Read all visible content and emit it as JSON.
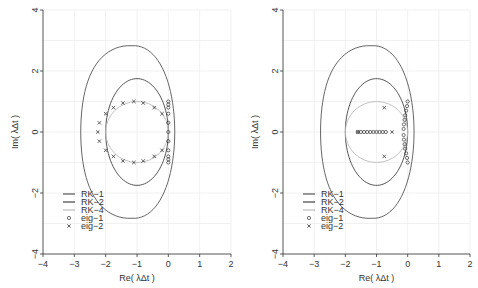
{
  "chart_data": [
    {
      "type": "scatter",
      "panel": "left",
      "xlabel": "Re( λΔt )",
      "ylabel": "Im( λΔt )",
      "xlim": [
        -4,
        2
      ],
      "ylim": [
        -4,
        4
      ],
      "xticks": [
        "-4",
        "-3",
        "-2",
        "-1",
        "0",
        "1",
        "2"
      ],
      "yticks": [
        "-4",
        "-2",
        "0",
        "2",
        "4"
      ],
      "grid": true,
      "legend": {
        "position": "bottom-left",
        "entries": [
          {
            "label": "RK-1",
            "style": "line",
            "color": "#555555"
          },
          {
            "label": "RK-2",
            "style": "line",
            "color": "#444444"
          },
          {
            "label": "RK-4",
            "style": "line",
            "color": "#bbbbbb"
          },
          {
            "label": "eig-1",
            "style": "circle",
            "color": "#333333"
          },
          {
            "label": "eig-2",
            "style": "cross",
            "color": "#333333"
          }
        ]
      },
      "series": [
        {
          "name": "RK-1",
          "shape": "circle",
          "center": [
            -1,
            0
          ],
          "radius": 1
        },
        {
          "name": "RK-2",
          "shape": "curve",
          "extent": {
            "xmin": -2,
            "xmax": 0,
            "ymin": -1.75,
            "ymax": 1.75
          }
        },
        {
          "name": "RK-4",
          "shape": "curve",
          "extent": {
            "xmin": -2.79,
            "xmax": 0.2,
            "ymin": -2.83,
            "ymax": 2.83
          }
        },
        {
          "name": "eig-1",
          "points": [
            [
              0,
              1
            ],
            [
              0,
              0.9
            ],
            [
              0,
              0.8
            ],
            [
              0,
              0.6
            ],
            [
              0,
              0.3
            ],
            [
              0,
              0
            ],
            [
              0,
              -0.3
            ],
            [
              0,
              -0.6
            ],
            [
              0,
              -0.8
            ],
            [
              0,
              -0.9
            ],
            [
              0,
              -1
            ]
          ]
        },
        {
          "name": "eig-2",
          "points": [
            [
              -2,
              0.6
            ],
            [
              -2.2,
              0.3
            ],
            [
              -2.25,
              0
            ],
            [
              -2.2,
              -0.3
            ],
            [
              -2,
              -0.6
            ],
            [
              -1.75,
              0.8
            ],
            [
              -1.45,
              0.95
            ],
            [
              -1.1,
              1
            ],
            [
              -0.8,
              0.95
            ],
            [
              -0.45,
              0.8
            ],
            [
              -0.2,
              0.6
            ],
            [
              -1.75,
              -0.8
            ],
            [
              -1.45,
              -0.95
            ],
            [
              -1.1,
              -1
            ],
            [
              -0.8,
              -0.95
            ],
            [
              -0.45,
              -0.8
            ],
            [
              -0.2,
              -0.6
            ]
          ]
        }
      ]
    },
    {
      "type": "scatter",
      "panel": "right",
      "xlabel": "Re( λΔt )",
      "ylabel": "Im( λΔt )",
      "xlim": [
        -4,
        2
      ],
      "ylim": [
        -4,
        4
      ],
      "xticks": [
        "-4",
        "-3",
        "-2",
        "-1",
        "0",
        "1",
        "2"
      ],
      "yticks": [
        "-4",
        "-2",
        "0",
        "2",
        "4"
      ],
      "grid": true,
      "legend": {
        "position": "bottom-left",
        "entries": [
          {
            "label": "RK-1",
            "style": "line",
            "color": "#555555"
          },
          {
            "label": "RK-2",
            "style": "line",
            "color": "#444444"
          },
          {
            "label": "RK-4",
            "style": "line",
            "color": "#bbbbbb"
          },
          {
            "label": "eig-1",
            "style": "circle",
            "color": "#333333"
          },
          {
            "label": "eig-2",
            "style": "cross",
            "color": "#333333"
          }
        ]
      },
      "series": [
        {
          "name": "RK-1",
          "shape": "circle",
          "center": [
            -1,
            0
          ],
          "radius": 1
        },
        {
          "name": "RK-2",
          "shape": "curve",
          "extent": {
            "xmin": -2,
            "xmax": 0,
            "ymin": -1.75,
            "ymax": 1.75
          }
        },
        {
          "name": "RK-4",
          "shape": "curve",
          "extent": {
            "xmin": -2.79,
            "xmax": 0.2,
            "ymin": -2.83,
            "ymax": 2.83
          }
        },
        {
          "name": "eig-1",
          "points": [
            [
              0,
              1
            ],
            [
              -0.02,
              0.85
            ],
            [
              -0.05,
              0.7
            ],
            [
              -0.08,
              0.55
            ],
            [
              -0.1,
              0.4
            ],
            [
              -0.12,
              0.25
            ],
            [
              -0.13,
              0.1
            ],
            [
              -0.13,
              -0.1
            ],
            [
              -0.12,
              -0.25
            ],
            [
              -0.1,
              -0.4
            ],
            [
              -0.08,
              -0.55
            ],
            [
              -0.05,
              -0.7
            ],
            [
              -0.02,
              -0.85
            ],
            [
              0,
              -1
            ],
            [
              -1.6,
              0
            ],
            [
              -1.5,
              0
            ],
            [
              -1.4,
              0
            ],
            [
              -1.3,
              0
            ],
            [
              -1.2,
              0
            ],
            [
              -1.1,
              0
            ],
            [
              -1.0,
              0
            ],
            [
              -0.9,
              0
            ],
            [
              -0.8,
              0
            ],
            [
              -0.7,
              0
            ]
          ]
        },
        {
          "name": "eig-2",
          "points": [
            [
              -0.75,
              0.8
            ],
            [
              -0.75,
              -0.8
            ],
            [
              -0.5,
              0
            ],
            [
              -1.6,
              0
            ]
          ]
        }
      ]
    }
  ]
}
